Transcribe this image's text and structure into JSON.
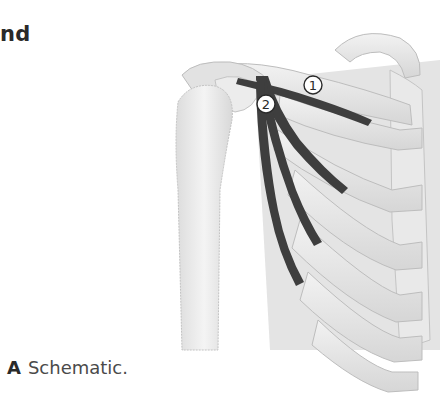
{
  "heading": {
    "text": "nd"
  },
  "caption": {
    "label": "A",
    "text": "Schematic."
  },
  "figure": {
    "markers": [
      {
        "id": "1",
        "label": "1",
        "structure": "muscle from clavicle toward first rib"
      },
      {
        "id": "2",
        "label": "2",
        "structure": "muscle from coracoid process fanning to ribs 3-5"
      }
    ],
    "colors": {
      "bone": "#ececec",
      "bone_shade": "#cfcfcf",
      "outline": "#b8b8b8",
      "muscle": "#3e3e3e",
      "marker_fill": "#ffffff",
      "marker_stroke": "#2a2a2a"
    }
  }
}
